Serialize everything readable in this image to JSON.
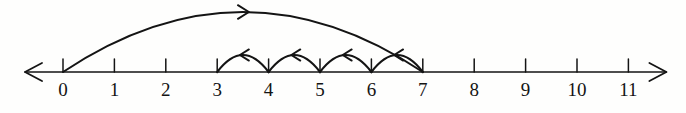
{
  "figure": {
    "title": "",
    "background_color": "#fefefd",
    "ink_color": "#141414"
  },
  "chart_data": {
    "type": "line",
    "title": "",
    "xlabel": "",
    "ylabel": "",
    "grid": false,
    "legend": null,
    "axis": {
      "orientation": "horizontal",
      "min_label": 0,
      "max_label": 11,
      "tick_step": 1,
      "tick_labels": [
        "0",
        "1",
        "2",
        "3",
        "4",
        "5",
        "6",
        "7",
        "8",
        "9",
        "10",
        "11"
      ],
      "tick_values": [
        0,
        1,
        2,
        3,
        4,
        5,
        6,
        7,
        8,
        9,
        10,
        11
      ],
      "left_arrowhead": true,
      "right_arrowhead": true
    },
    "jumps": [
      {
        "name": "forward-jump",
        "from": 0,
        "to": 7,
        "length": 7,
        "direction": "right",
        "style": "large-arc",
        "arrow_position": "apex"
      },
      {
        "name": "back-hop-1",
        "from": 7,
        "to": 6,
        "length": 1,
        "direction": "left",
        "style": "small-arc",
        "arrow_position": "apex"
      },
      {
        "name": "back-hop-2",
        "from": 6,
        "to": 5,
        "length": 1,
        "direction": "left",
        "style": "small-arc",
        "arrow_position": "apex"
      },
      {
        "name": "back-hop-3",
        "from": 5,
        "to": 4,
        "length": 1,
        "direction": "left",
        "style": "small-arc",
        "arrow_position": "apex"
      },
      {
        "name": "back-hop-4",
        "from": 4,
        "to": 3,
        "length": 1,
        "direction": "left",
        "style": "small-arc",
        "arrow_position": "apex"
      }
    ],
    "annotations": []
  },
  "labels": [
    {
      "text": "0",
      "value": 0
    },
    {
      "text": "1",
      "value": 1
    },
    {
      "text": "2",
      "value": 2
    },
    {
      "text": "3",
      "value": 3
    },
    {
      "text": "4",
      "value": 4
    },
    {
      "text": "5",
      "value": 5
    },
    {
      "text": "6",
      "value": 6
    },
    {
      "text": "7",
      "value": 7
    },
    {
      "text": "8",
      "value": 8
    },
    {
      "text": "9",
      "value": 9
    },
    {
      "text": "10",
      "value": 10
    },
    {
      "text": "11",
      "value": 11
    }
  ]
}
